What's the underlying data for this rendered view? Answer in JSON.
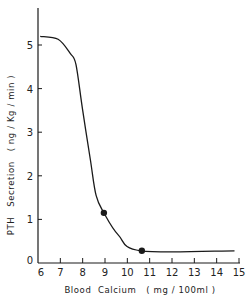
{
  "chart_data": {
    "type": "line",
    "title": "",
    "xlabel": "Blood  Calcium   ( mg / 100ml )",
    "ylabel": "PTH   Secretion   ( ng / Kg / min )",
    "xlim": [
      6,
      15
    ],
    "ylim": [
      0,
      5.4
    ],
    "x_ticks": [
      6,
      7,
      8,
      9,
      10,
      11,
      12,
      13,
      14,
      15
    ],
    "y_ticks": [
      0,
      1,
      2,
      3,
      4,
      5
    ],
    "grid": false,
    "legend": null,
    "series": [
      {
        "name": "PTH secretion curve",
        "style": "smooth line",
        "x": [
          6.1,
          6.9,
          7.45,
          7.7,
          8.0,
          8.35,
          8.6,
          8.95,
          9.6,
          10.6,
          14.8
        ],
        "y": [
          5.2,
          5.13,
          4.8,
          4.55,
          3.5,
          2.35,
          1.55,
          1.15,
          0.64,
          0.28,
          0.28
        ]
      },
      {
        "name": "Marked points",
        "style": "filled circle markers",
        "x": [
          8.95,
          10.65
        ],
        "y": [
          1.15,
          0.28
        ]
      }
    ]
  },
  "axes": {
    "x_title": "Blood  Calcium   ( mg / 100ml )",
    "y_title": "PTH   Secretion   ( ng / Kg / min )",
    "x_tick_labels": [
      "6",
      "7",
      "8",
      "9",
      "10",
      "11",
      "12",
      "13",
      "14",
      "15"
    ],
    "y_tick_labels": [
      "0",
      "1",
      "2",
      "3",
      "4",
      "5"
    ]
  },
  "colors": {
    "line": "#1a1a1a",
    "background": "#ffffff"
  }
}
